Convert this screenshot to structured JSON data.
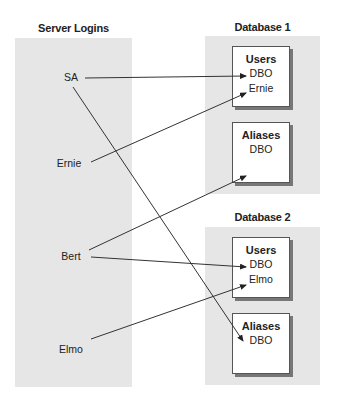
{
  "server": {
    "title": "Server Logins",
    "logins": [
      "SA",
      "Ernie",
      "Bert",
      "Elmo"
    ]
  },
  "databases": [
    {
      "title": "Database 1",
      "users": {
        "header": "Users",
        "items": [
          "DBO",
          "Ernie"
        ]
      },
      "aliases": {
        "header": "Aliases",
        "items": [
          "DBO"
        ]
      }
    },
    {
      "title": "Database 2",
      "users": {
        "header": "Users",
        "items": [
          "DBO",
          "Elmo"
        ]
      },
      "aliases": {
        "header": "Aliases",
        "items": [
          "DBO"
        ]
      }
    }
  ],
  "mappings": [
    {
      "from": "SA",
      "to": "Database 1 / Users / DBO"
    },
    {
      "from": "SA",
      "to": "Database 2 / Aliases / DBO"
    },
    {
      "from": "Ernie",
      "to": "Database 1 / Users / Ernie"
    },
    {
      "from": "Bert",
      "to": "Database 1 / Aliases / DBO"
    },
    {
      "from": "Bert",
      "to": "Database 2 / Users / DBO"
    },
    {
      "from": "Elmo",
      "to": "Database 2 / Users / Elmo"
    }
  ]
}
